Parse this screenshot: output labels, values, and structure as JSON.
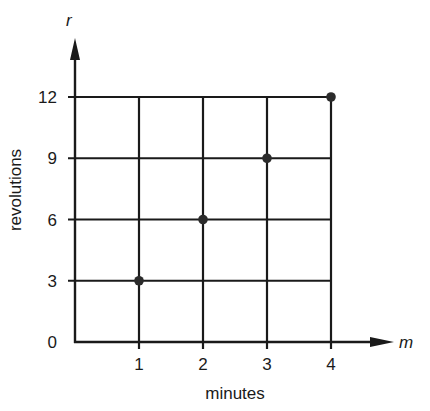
{
  "chart_data": {
    "type": "scatter",
    "title": "",
    "xlabel": "minutes",
    "ylabel": "revolutions",
    "x_variable": "m",
    "y_variable": "r",
    "x_ticks": [
      "1",
      "2",
      "3",
      "4"
    ],
    "y_ticks": [
      "0",
      "3",
      "6",
      "9",
      "12"
    ],
    "xlim": [
      0,
      4
    ],
    "ylim": [
      0,
      12
    ],
    "grid": true,
    "legend": "none",
    "series": [
      {
        "name": "revolutions vs minutes",
        "x": [
          1,
          2,
          3,
          4
        ],
        "y": [
          3,
          6,
          9,
          12
        ]
      }
    ],
    "colors": {
      "line": "#1a1a1a",
      "point": "#2b2b2b"
    }
  }
}
